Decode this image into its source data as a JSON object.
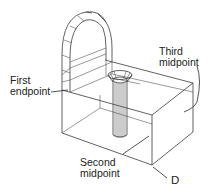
{
  "diagram": {
    "type": "isometric-wireframe",
    "line_color": "#3a3a3a",
    "background": "#ffffff",
    "labels": {
      "first_endpoint": "First\nendpoint",
      "second_midpoint": "Second\nmidpoint",
      "third_midpoint": "Third\nmidpoint",
      "d": "D"
    }
  }
}
